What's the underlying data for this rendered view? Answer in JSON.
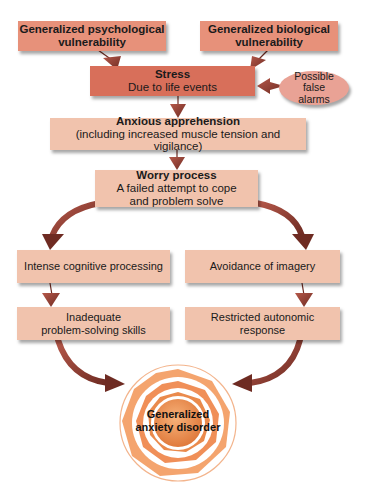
{
  "diagram": {
    "nodes": {
      "psych_vulnerability": {
        "line1": "Generalized psychological",
        "line2": "vulnerability"
      },
      "bio_vulnerability": {
        "line1": "Generalized biological",
        "line2": "vulnerability"
      },
      "stress": {
        "title": "Stress",
        "subtitle": "Due to life events"
      },
      "false_alarms": {
        "line1": "Possible",
        "line2": "false",
        "line3": "alarms"
      },
      "anxious_apprehension": {
        "title": "Anxious apprehension",
        "subtitle": "(including increased muscle tension and vigilance)"
      },
      "worry_process": {
        "title": "Worry process",
        "line1": "A failed attempt to cope",
        "line2": "and problem solve"
      },
      "intense_cognitive": {
        "label": "Intense cognitive processing"
      },
      "avoidance_imagery": {
        "label": "Avoidance of imagery"
      },
      "inadequate_problem_solving": {
        "line1": "Inadequate",
        "line2": "problem-solving skills"
      },
      "restricted_autonomic": {
        "line1": "Restricted autonomic",
        "line2": "response"
      },
      "gad": {
        "line1": "Generalized",
        "line2": "anxiety disorder"
      }
    },
    "edges": [
      {
        "from": "psych_vulnerability",
        "to": "stress"
      },
      {
        "from": "bio_vulnerability",
        "to": "stress"
      },
      {
        "from": "false_alarms",
        "to": "stress"
      },
      {
        "from": "stress",
        "to": "anxious_apprehension"
      },
      {
        "from": "anxious_apprehension",
        "to": "worry_process"
      },
      {
        "from": "worry_process",
        "to": "intense_cognitive"
      },
      {
        "from": "worry_process",
        "to": "avoidance_imagery"
      },
      {
        "from": "intense_cognitive",
        "to": "inadequate_problem_solving"
      },
      {
        "from": "avoidance_imagery",
        "to": "restricted_autonomic"
      },
      {
        "from": "inadequate_problem_solving",
        "to": "gad"
      },
      {
        "from": "restricted_autonomic",
        "to": "gad"
      }
    ],
    "colors": {
      "top_boxes": "#e7917a",
      "stress_box": "#d86f5a",
      "ellipse": "#e9a295",
      "lower_boxes": "#f1c3ad",
      "arrows": "#8a3b2e",
      "target_rings": "#f0a070",
      "target_center": "#e98a4a"
    }
  }
}
